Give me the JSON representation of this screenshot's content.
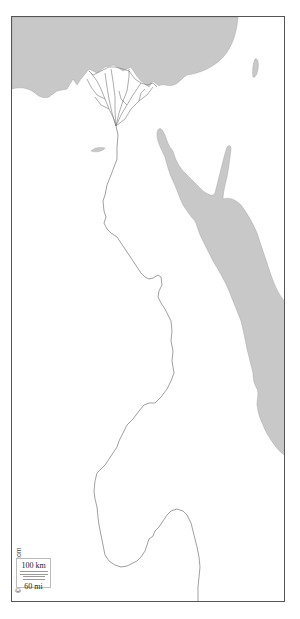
{
  "map": {
    "region": "Egypt and Nile Valley with Red Sea",
    "colors": {
      "water": "#c8c8c8",
      "land": "#ffffff",
      "border": "#555555",
      "river": "#777777"
    },
    "features": [
      {
        "name": "Mediterranean Sea",
        "type": "water"
      },
      {
        "name": "Nile Delta",
        "type": "river-delta"
      },
      {
        "name": "Nile River",
        "type": "river"
      },
      {
        "name": "Red Sea",
        "type": "water"
      },
      {
        "name": "Gulf of Suez",
        "type": "water"
      },
      {
        "name": "Gulf of Aqaba",
        "type": "water"
      },
      {
        "name": "Lake Qarun",
        "type": "water"
      },
      {
        "name": "Dead Sea",
        "type": "water"
      }
    ]
  },
  "credit": "© d-maps.com",
  "scale": {
    "km_label": "100 km",
    "mi_label": "60 mi"
  }
}
